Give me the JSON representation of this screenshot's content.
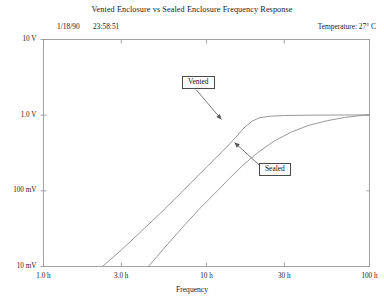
{
  "header": {
    "title": "Vented Enclosure vs Sealed Enclosure Frequency Response",
    "date": "1/18/90",
    "time": "23:58:51",
    "temperature": "Temperature:  27° C"
  },
  "axes": {
    "y_ticks": [
      "10 V",
      "1.0 V",
      "100 mV",
      "10 mV"
    ],
    "x_ticks": [
      "1.0 h",
      "3.0 h",
      "10 h",
      "30 h",
      "100 h"
    ],
    "x_title": "Frequency",
    "y_title": ""
  },
  "annotations": [
    {
      "label": "Vented"
    },
    {
      "label": "Sealed"
    }
  ],
  "colors": {
    "frame": "#9a9a9a",
    "curve": "#8c8c8c",
    "leader": "#555555",
    "text": "#1a1a1a",
    "background": "#ffffff"
  },
  "chart_data": {
    "type": "line",
    "title": "Vented Enclosure vs Sealed Enclosure Frequency Response",
    "xlabel": "Frequency",
    "ylabel": "",
    "x_scale": "log",
    "y_scale": "log",
    "xlim": [
      1.0,
      100.0
    ],
    "ylim": [
      0.01,
      10.0
    ],
    "x_tick_values": [
      1.0,
      3.0,
      10.0,
      30.0,
      100.0
    ],
    "x_tick_labels": [
      "1.0 h",
      "3.0 h",
      "10 h",
      "30 h",
      "100 h"
    ],
    "y_tick_values": [
      10.0,
      1.0,
      0.1,
      0.01
    ],
    "y_tick_labels": [
      "10 V",
      "1.0 V",
      "100 mV",
      "10 mV"
    ],
    "grid": false,
    "legend": "annotated-callouts",
    "series": [
      {
        "name": "Vented",
        "annotation": "Vented",
        "points": [
          [
            2.3,
            0.01
          ],
          [
            3.0,
            0.0165
          ],
          [
            4.0,
            0.0295
          ],
          [
            5.5,
            0.0565
          ],
          [
            7.5,
            0.11
          ],
          [
            10.0,
            0.205
          ],
          [
            13.0,
            0.36
          ],
          [
            15.0,
            0.5
          ],
          [
            17.0,
            0.68
          ],
          [
            19.0,
            0.83
          ],
          [
            21.0,
            0.92
          ],
          [
            24.0,
            0.965
          ],
          [
            30.0,
            0.99
          ],
          [
            45.0,
            1.0
          ],
          [
            70.0,
            1.005
          ],
          [
            100.0,
            1.01
          ]
        ]
      },
      {
        "name": "Sealed",
        "annotation": "Sealed",
        "points": [
          [
            4.4,
            0.01
          ],
          [
            5.5,
            0.0175
          ],
          [
            7.0,
            0.0315
          ],
          [
            9.0,
            0.057
          ],
          [
            11.0,
            0.088
          ],
          [
            14.0,
            0.15
          ],
          [
            17.0,
            0.225
          ],
          [
            21.0,
            0.33
          ],
          [
            26.0,
            0.455
          ],
          [
            33.0,
            0.595
          ],
          [
            42.0,
            0.73
          ],
          [
            55.0,
            0.845
          ],
          [
            70.0,
            0.93
          ],
          [
            85.0,
            0.98
          ],
          [
            100.0,
            1.01
          ]
        ]
      }
    ]
  }
}
